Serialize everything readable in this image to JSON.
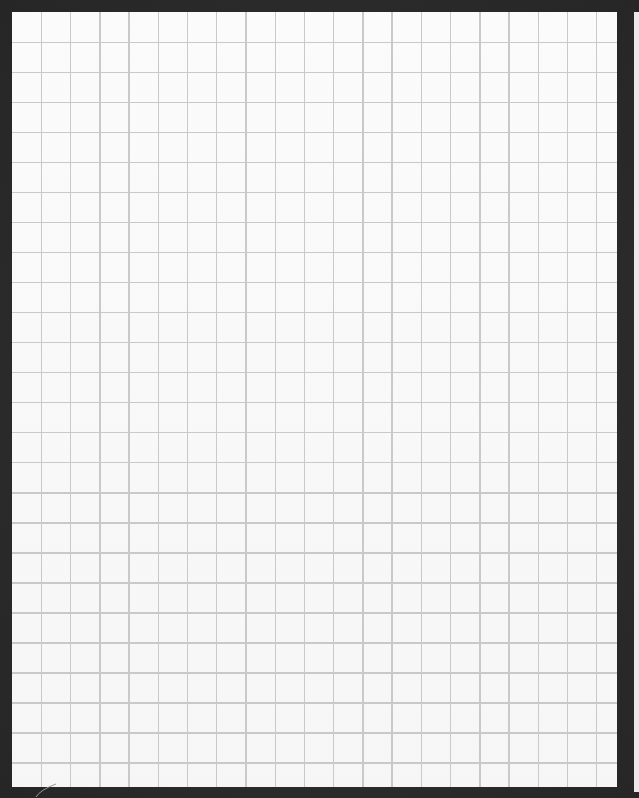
{
  "image": {
    "subject": "sheet of blank square-grid graph paper on a dark background",
    "grid": {
      "columns": 21,
      "rows": 26,
      "line_color": "#c9c9c9",
      "paper_color": "#f8f8f8",
      "background_color": "#2a2a2a"
    },
    "annotations": []
  }
}
